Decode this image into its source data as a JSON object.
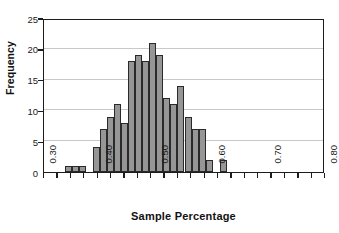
{
  "header": {
    "clipped_text": "Sun Solution 2Ct 4Ot"
  },
  "chart_data": {
    "type": "bar",
    "title": "",
    "subtitle": "",
    "xlabel": "Sample Percentage",
    "ylabel": "Frequency",
    "xlim": [
      0.3,
      0.8
    ],
    "ylim": [
      0,
      25
    ],
    "grid": true,
    "legend": null,
    "bin_width": 0.0125,
    "bin_starts": [
      0.3,
      0.3125,
      0.325,
      0.3375,
      0.35,
      0.3625,
      0.375,
      0.3875,
      0.4,
      0.4125,
      0.425,
      0.4375,
      0.45,
      0.4625,
      0.475,
      0.4875,
      0.5,
      0.5125,
      0.525,
      0.5375,
      0.55,
      0.5625,
      0.575,
      0.5875,
      0.6,
      0.6125,
      0.625,
      0.6375,
      0.65,
      0.6625,
      0.675,
      0.6875,
      0.7,
      0.7125,
      0.725,
      0.7375,
      0.75,
      0.7625,
      0.775,
      0.7875
    ],
    "values": [
      0,
      0,
      0,
      1,
      1,
      1,
      0,
      0,
      4,
      7,
      9,
      11,
      8,
      0,
      18,
      19,
      18,
      21,
      19,
      12,
      11,
      14,
      9,
      7,
      7,
      2,
      0,
      2,
      0,
      0,
      0,
      0,
      0,
      0,
      0,
      0,
      0,
      0,
      0,
      0
    ],
    "bars": [
      {
        "x0": 0.3375,
        "x1": 0.35,
        "value": 1
      },
      {
        "x0": 0.35,
        "x1": 0.3625,
        "value": 1
      },
      {
        "x0": 0.3625,
        "x1": 0.375,
        "value": 1
      },
      {
        "x0": 0.3875,
        "x1": 0.4,
        "value": 4
      },
      {
        "x0": 0.4,
        "x1": 0.4125,
        "value": 7
      },
      {
        "x0": 0.4125,
        "x1": 0.425,
        "value": 9
      },
      {
        "x0": 0.425,
        "x1": 0.4375,
        "value": 11
      },
      {
        "x0": 0.4375,
        "x1": 0.45,
        "value": 8
      },
      {
        "x0": 0.45,
        "x1": 0.4625,
        "value": 18
      },
      {
        "x0": 0.4625,
        "x1": 0.475,
        "value": 19
      },
      {
        "x0": 0.475,
        "x1": 0.4875,
        "value": 18
      },
      {
        "x0": 0.4875,
        "x1": 0.5,
        "value": 21
      },
      {
        "x0": 0.5,
        "x1": 0.5125,
        "value": 19
      },
      {
        "x0": 0.5125,
        "x1": 0.525,
        "value": 12
      },
      {
        "x0": 0.525,
        "x1": 0.5375,
        "value": 11
      },
      {
        "x0": 0.5375,
        "x1": 0.55,
        "value": 14
      },
      {
        "x0": 0.55,
        "x1": 0.5625,
        "value": 9
      },
      {
        "x0": 0.5625,
        "x1": 0.575,
        "value": 7
      },
      {
        "x0": 0.575,
        "x1": 0.5875,
        "value": 7
      },
      {
        "x0": 0.5875,
        "x1": 0.6,
        "value": 2
      },
      {
        "x0": 0.6125,
        "x1": 0.625,
        "value": 2
      }
    ],
    "y_ticks": [
      0,
      5,
      10,
      15,
      20,
      25
    ],
    "y_tick_labels": [
      "0",
      "5",
      "10",
      "15",
      "20",
      "25"
    ],
    "x_ticks": [
      0.3,
      0.4,
      0.5,
      0.6,
      0.7,
      0.8
    ],
    "x_tick_labels": [
      "0.30",
      "0.40",
      "0.50",
      "0.60",
      "0.70",
      "0.80"
    ],
    "x_minor_tick_count": 21,
    "colors": {
      "bar_fill": "#969696",
      "bar_edge": "#2a2a2a",
      "gridline": "#c9c9c9",
      "axis": "#1c1c1c",
      "text": "#121212",
      "background": "#ffffff"
    }
  }
}
